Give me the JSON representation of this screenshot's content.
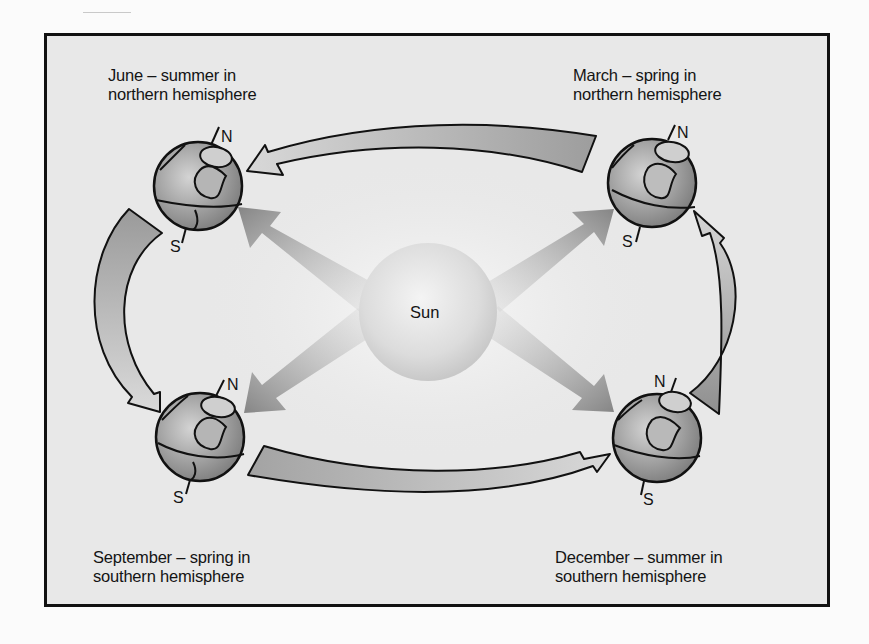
{
  "diagram": {
    "title_hint": "Earth's orbit around the Sun and the seasons",
    "center": {
      "label": "Sun"
    },
    "positions": [
      {
        "id": "june",
        "line1": "June – summer in",
        "line2": "northern hemisphere",
        "north": "N",
        "south": "S"
      },
      {
        "id": "march",
        "line1": "March – spring in",
        "line2": "northern hemisphere",
        "north": "N",
        "south": "S"
      },
      {
        "id": "september",
        "line1": "September – spring in",
        "line2": "southern hemisphere",
        "north": "N",
        "south": "S"
      },
      {
        "id": "december",
        "line1": "December – summer in",
        "line2": "southern hemisphere",
        "north": "N",
        "south": "S"
      }
    ],
    "orbit_direction": [
      "March",
      "June",
      "September",
      "December",
      "March"
    ],
    "colors": {
      "frame_border": "#111111",
      "background": "#e8e8e8",
      "arrow_fill": "#b8b8b8",
      "ray_fill": "#8c8c8c",
      "globe_fill": "#a9a9a9"
    }
  }
}
